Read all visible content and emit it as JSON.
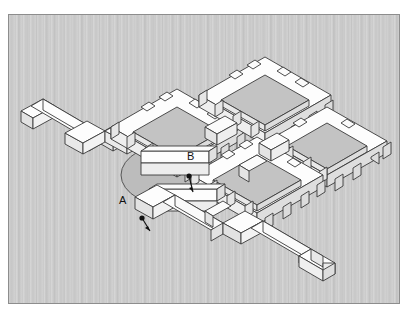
{
  "figure": {
    "kind": "isometric-site-plan",
    "background_color": "#c9c9c9",
    "border_color": "#8d8d8d",
    "wall_top_color": "#fdfdfd",
    "wall_side_light_color": "#f2f2f2",
    "wall_side_dark_color": "#e2e2e2",
    "courtyard_floor_color": "#c3c3c3",
    "line_color": "#3a3a3a",
    "label_color": "#111111"
  },
  "labels": [
    {
      "id": "A",
      "text": "A",
      "x": 118,
      "y": 200,
      "dot_x": 133,
      "dot_y": 203
    },
    {
      "id": "B",
      "text": "B",
      "x": 186,
      "y": 156,
      "dot_x": 180,
      "dot_y": 161
    }
  ],
  "structures": {
    "courtyards": [
      {
        "name": "north-east-courtyard"
      },
      {
        "name": "north-west-courtyard"
      },
      {
        "name": "east-courtyard"
      },
      {
        "name": "south-courtyard"
      }
    ],
    "plaza": {
      "name": "central-circular-plaza"
    },
    "arms": [
      {
        "name": "north-west-zigzag-wall-arm"
      },
      {
        "name": "south-east-zigzag-wall-arm"
      }
    ]
  }
}
